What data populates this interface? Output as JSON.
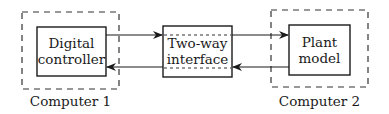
{
  "diagram": {
    "groups": [
      {
        "id": "computer1",
        "label": "Computer 1"
      },
      {
        "id": "computer2",
        "label": "Computer 2"
      }
    ],
    "blocks": [
      {
        "id": "digital_controller",
        "lines": [
          "Digital",
          "controller"
        ],
        "group": "computer1"
      },
      {
        "id": "two_way_interface",
        "lines": [
          "Two-way",
          "interface"
        ],
        "group": null
      },
      {
        "id": "plant_model",
        "lines": [
          "Plant",
          "model"
        ],
        "group": "computer2"
      }
    ],
    "edges": [
      {
        "from": "digital_controller",
        "to": "two_way_interface",
        "direction": "right"
      },
      {
        "from": "two_way_interface",
        "to": "plant_model",
        "direction": "right"
      },
      {
        "from": "plant_model",
        "to": "two_way_interface",
        "direction": "left"
      },
      {
        "from": "two_way_interface",
        "to": "digital_controller",
        "direction": "left"
      }
    ]
  }
}
